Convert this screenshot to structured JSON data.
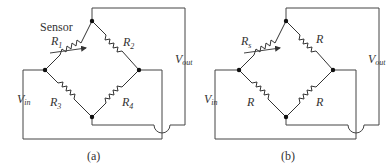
{
  "figure": {
    "panels": [
      {
        "id": "a",
        "caption": "(a)",
        "sensor_label": "Sensor",
        "resistors": [
          {
            "pos": "top-left",
            "label": "R",
            "sub": "1",
            "variable": true
          },
          {
            "pos": "top-right",
            "label": "R",
            "sub": "2",
            "variable": false
          },
          {
            "pos": "bottom-left",
            "label": "R",
            "sub": "3",
            "variable": false
          },
          {
            "pos": "bottom-right",
            "label": "R",
            "sub": "4",
            "variable": false
          }
        ],
        "vin": {
          "label": "V",
          "sub": "in"
        },
        "vout": {
          "label": "V",
          "sub": "out"
        }
      },
      {
        "id": "b",
        "caption": "(b)",
        "resistors": [
          {
            "pos": "top-left",
            "label": "R",
            "sub": "s",
            "variable": true
          },
          {
            "pos": "top-right",
            "label": "R",
            "sub": "",
            "variable": false
          },
          {
            "pos": "bottom-left",
            "label": "R",
            "sub": "",
            "variable": false
          },
          {
            "pos": "bottom-right",
            "label": "R",
            "sub": "",
            "variable": false
          }
        ],
        "vin": {
          "label": "V",
          "sub": "in"
        },
        "vout": {
          "label": "V",
          "sub": "out"
        }
      }
    ]
  }
}
